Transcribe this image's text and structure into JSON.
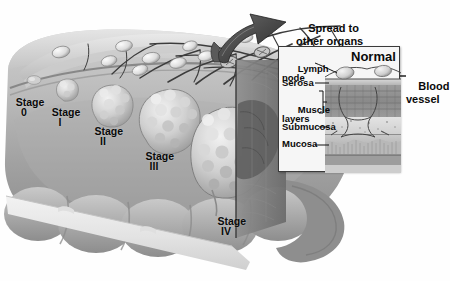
{
  "figure": {
    "style": "grayscale medical illustration",
    "background_color": "#ffffff"
  },
  "callout": {
    "text_line1": "Spread to",
    "text_line2": "other organs",
    "arrow": "curved-thick-arrow-up-left"
  },
  "stages": [
    {
      "id": "stage-0",
      "line1": "Stage",
      "line2": "0",
      "x": 10,
      "y": 86
    },
    {
      "id": "stage-1",
      "line1": "Stage",
      "line2": "I",
      "x": 46,
      "y": 96
    },
    {
      "id": "stage-2",
      "line1": "Stage",
      "line2": "II",
      "x": 88,
      "y": 115
    },
    {
      "id": "stage-3",
      "line1": "Stage",
      "line2": "III",
      "x": 140,
      "y": 140
    },
    {
      "id": "stage-4",
      "line1": "Stage",
      "line2": "IV",
      "x": 212,
      "y": 205
    }
  ],
  "inset": {
    "title": "Normal",
    "border_color": "#3a3a3a",
    "labels": [
      {
        "id": "lymph-node",
        "line1": "Lymph",
        "line2": "node",
        "x": 3,
        "y": 7
      },
      {
        "id": "serosa",
        "line1": "Serosa",
        "line2": "",
        "x": 3,
        "y": 34
      },
      {
        "id": "muscle-layers",
        "line1": "Muscle",
        "line2": "layers",
        "x": 3,
        "y": 50
      },
      {
        "id": "submucosa",
        "line1": "Submucosa",
        "line2": "",
        "x": 3,
        "y": 78
      },
      {
        "id": "mucosa",
        "line1": "Mucosa",
        "line2": "",
        "x": 3,
        "y": 94
      }
    ],
    "layer_names": [
      "Serosa",
      "Muscle layers",
      "Submucosa",
      "Mucosa"
    ]
  },
  "blood_vessel": {
    "line1": "Blood",
    "line2": "vessel",
    "x": 406,
    "y": 68
  },
  "colors": {
    "ink": "#0a0a0a",
    "colon_light": "#d8d8d8",
    "colon_mid": "#a9a9a9",
    "colon_dark": "#6e6e6e",
    "tumor_light": "#e2e2e2",
    "tumor_mid": "#b4b4b4",
    "cut_plane": "#7d7d7d",
    "vessel": "#3c3c3c",
    "node": "#efefef",
    "inset_bg": "#f6f6f6"
  }
}
